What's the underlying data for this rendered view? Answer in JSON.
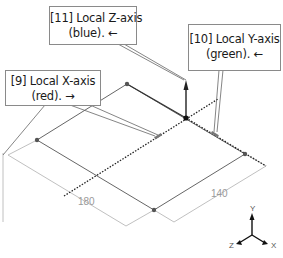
{
  "callouts": [
    {
      "id": "11",
      "line1": "[11] Local Z-axis",
      "line2": "(blue).  ←",
      "axis": "Z",
      "color_name": "blue"
    },
    {
      "id": "10",
      "line1": "[10] Local Y-axis",
      "line2": "(green).  ←",
      "axis": "Y",
      "color_name": "green"
    },
    {
      "id": "9",
      "line1": "[9] Local X-axis",
      "line2": "(red).  →",
      "axis": "X",
      "color_name": "red"
    }
  ],
  "dimensions": {
    "length": "180",
    "width": "140"
  },
  "triad": {
    "x_label": "X",
    "y_label": "Y",
    "z_label": "Z"
  },
  "colors": {
    "outline": "#555555",
    "dimension": "#9a9a9a",
    "axis_line": "#222222",
    "callout_border": "#8a8a8a"
  }
}
